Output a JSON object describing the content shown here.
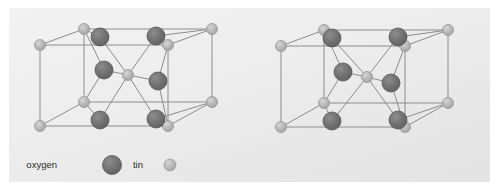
{
  "figure": {
    "background_color": "#ffffff",
    "panel_color": "#eeeeee",
    "panel_color_edge": "#e3e3e3",
    "panel": {
      "x": 9,
      "y": 8,
      "width": 481,
      "height": 174
    }
  },
  "legend": {
    "items": [
      {
        "label": "oxygen",
        "swatch_name": "oxygen-swatch",
        "color": "#6e6e6e",
        "edge_color": "#5a5a5a",
        "radius": 9.5,
        "label_x": 57,
        "label_y": 165,
        "swatch_x": 112,
        "swatch_y": 165
      },
      {
        "label": "tin",
        "swatch_name": "tin-swatch",
        "color": "#b4b4b4",
        "edge_color": "#9a9a9a",
        "radius": 6.0,
        "label_x": 143,
        "label_y": 165,
        "swatch_x": 170,
        "swatch_y": 165
      }
    ]
  },
  "colors": {
    "oxygen": "#6e6e6e",
    "oxygen_edge": "#565656",
    "oxygen_highlight": "#8a8a8a",
    "tin": "#b4b4b4",
    "tin_edge": "#969696",
    "tin_highlight": "#d2d2d2",
    "cell_edge": "#8c8c8c",
    "bond": "#8c8c8c"
  },
  "chart_data": {
    "type": "scatter",
    "xlabel": "",
    "ylabel": "",
    "legend": [
      "oxygen",
      "tin"
    ],
    "legend_position": "bottom-left",
    "grid": false,
    "cells": [
      {
        "name": "left-unit-cell",
        "radius_oxygen": 9.0,
        "radius_tin": 5.5,
        "tin_sites": [
          {
            "id": "sn-top-back-left",
            "x": 84,
            "y": 29
          },
          {
            "id": "sn-top-front-left",
            "x": 40,
            "y": 45
          },
          {
            "id": "sn-top-front-right",
            "x": 168,
            "y": 45
          },
          {
            "id": "sn-top-back-right",
            "x": 212,
            "y": 29
          },
          {
            "id": "sn-center",
            "x": 128,
            "y": 75
          },
          {
            "id": "sn-bot-back-left",
            "x": 84,
            "y": 102
          },
          {
            "id": "sn-bot-front-left",
            "x": 40,
            "y": 126
          },
          {
            "id": "sn-bot-front-right",
            "x": 168,
            "y": 126
          },
          {
            "id": "sn-bot-back-right",
            "x": 212,
            "y": 102
          }
        ],
        "oxygen_sites": [
          {
            "id": "o-top-left",
            "x": 100,
            "y": 37
          },
          {
            "id": "o-top-right",
            "x": 156,
            "y": 36
          },
          {
            "id": "o-mid-left",
            "x": 104,
            "y": 70
          },
          {
            "id": "o-mid-right",
            "x": 158,
            "y": 81
          },
          {
            "id": "o-bot-left",
            "x": 100,
            "y": 120
          },
          {
            "id": "o-bot-right",
            "x": 156,
            "y": 119
          }
        ],
        "bonds": [
          [
            "sn-center",
            "o-top-left"
          ],
          [
            "sn-center",
            "o-top-right"
          ],
          [
            "sn-center",
            "o-mid-left"
          ],
          [
            "sn-center",
            "o-mid-right"
          ],
          [
            "sn-center",
            "o-bot-left"
          ],
          [
            "sn-center",
            "o-bot-right"
          ],
          [
            "sn-top-back-left",
            "o-top-left"
          ],
          [
            "sn-top-back-left",
            "o-mid-left"
          ],
          [
            "sn-top-back-right",
            "o-top-right"
          ],
          [
            "sn-top-front-right",
            "o-top-right"
          ],
          [
            "sn-top-front-right",
            "o-mid-right"
          ],
          [
            "sn-bot-back-left",
            "o-bot-left"
          ],
          [
            "sn-bot-back-left",
            "o-mid-left"
          ],
          [
            "sn-bot-back-right",
            "o-bot-right"
          ],
          [
            "sn-bot-front-right",
            "o-bot-right"
          ],
          [
            "sn-bot-front-right",
            "o-mid-right"
          ]
        ]
      },
      {
        "name": "right-unit-cell",
        "radius_oxygen": 9.0,
        "radius_tin": 5.5,
        "tin_sites": [
          {
            "id": "sn-top-back-left",
            "x": 324,
            "y": 30
          },
          {
            "id": "sn-top-front-left",
            "x": 281,
            "y": 46
          },
          {
            "id": "sn-top-front-right",
            "x": 405,
            "y": 46
          },
          {
            "id": "sn-top-back-right",
            "x": 448,
            "y": 30
          },
          {
            "id": "sn-center",
            "x": 367,
            "y": 77
          },
          {
            "id": "sn-bot-back-left",
            "x": 324,
            "y": 103
          },
          {
            "id": "sn-bot-front-left",
            "x": 281,
            "y": 127
          },
          {
            "id": "sn-bot-front-right",
            "x": 405,
            "y": 127
          },
          {
            "id": "sn-bot-back-right",
            "x": 448,
            "y": 103
          }
        ],
        "oxygen_sites": [
          {
            "id": "o-top-left",
            "x": 332,
            "y": 38
          },
          {
            "id": "o-top-right",
            "x": 398,
            "y": 37
          },
          {
            "id": "o-mid-left",
            "x": 343,
            "y": 72
          },
          {
            "id": "o-mid-right",
            "x": 391,
            "y": 83
          },
          {
            "id": "o-bot-left",
            "x": 332,
            "y": 121
          },
          {
            "id": "o-bot-right",
            "x": 398,
            "y": 120
          }
        ],
        "bonds": [
          [
            "sn-center",
            "o-top-left"
          ],
          [
            "sn-center",
            "o-top-right"
          ],
          [
            "sn-center",
            "o-mid-left"
          ],
          [
            "sn-center",
            "o-mid-right"
          ],
          [
            "sn-center",
            "o-bot-left"
          ],
          [
            "sn-center",
            "o-bot-right"
          ],
          [
            "sn-top-back-left",
            "o-top-left"
          ],
          [
            "sn-top-back-left",
            "o-mid-left"
          ],
          [
            "sn-top-back-right",
            "o-top-right"
          ],
          [
            "sn-top-front-right",
            "o-top-right"
          ],
          [
            "sn-top-front-right",
            "o-mid-right"
          ],
          [
            "sn-bot-back-left",
            "o-bot-left"
          ],
          [
            "sn-bot-back-left",
            "o-mid-left"
          ],
          [
            "sn-bot-back-right",
            "o-bot-right"
          ],
          [
            "sn-bot-front-right",
            "o-bot-right"
          ],
          [
            "sn-bot-front-right",
            "o-mid-right"
          ]
        ]
      }
    ],
    "cell_frame_edges": [
      [
        "sn-top-front-left",
        "sn-top-back-left"
      ],
      [
        "sn-top-back-left",
        "sn-top-back-right"
      ],
      [
        "sn-top-back-right",
        "sn-top-front-right"
      ],
      [
        "sn-top-front-right",
        "sn-top-front-left"
      ],
      [
        "sn-bot-front-left",
        "sn-bot-back-left"
      ],
      [
        "sn-bot-back-left",
        "sn-bot-back-right"
      ],
      [
        "sn-bot-back-right",
        "sn-bot-front-right"
      ],
      [
        "sn-bot-front-right",
        "sn-bot-front-left"
      ],
      [
        "sn-top-front-left",
        "sn-bot-front-left"
      ],
      [
        "sn-top-back-left",
        "sn-bot-back-left"
      ],
      [
        "sn-top-back-right",
        "sn-bot-back-right"
      ],
      [
        "sn-top-front-right",
        "sn-bot-front-right"
      ]
    ]
  }
}
